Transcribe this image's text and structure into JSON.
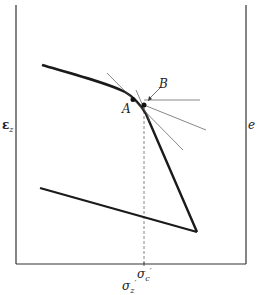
{
  "diagram": {
    "left_axis_label": "ε",
    "left_axis_sub": "z",
    "right_axis_label": "e",
    "x_axis_label": "σ",
    "x_axis_sub": "z",
    "x_axis_prime": "′",
    "marker_label": "σ",
    "marker_sub": "c",
    "marker_prime": "′",
    "point_a_label": "A",
    "point_b_label": "B",
    "colors": {
      "line": "#1a1a1a",
      "thin": "#555555",
      "dash": "#666666"
    }
  }
}
